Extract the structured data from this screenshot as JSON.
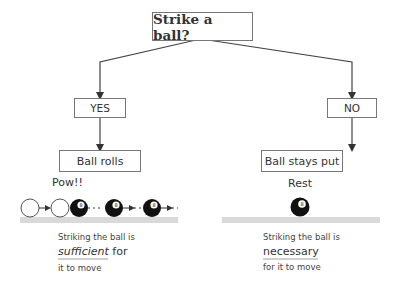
{
  "root": {
    "label": "Strike a ball?"
  },
  "branches": [
    {
      "decision": "YES",
      "outcome": "Ball rolls",
      "scene_label": "Pow!!",
      "caption": {
        "line1": "Striking the ball is",
        "keyword": "sufficient",
        "after_keyword": " for",
        "line3": "it to move"
      }
    },
    {
      "decision": "NO",
      "outcome": "Ball stays put",
      "scene_label": "Rest",
      "caption": {
        "line1": "Striking the ball is",
        "keyword": "necessary",
        "after_keyword": "",
        "line3": "for it to move"
      }
    }
  ],
  "colors": {
    "line": "#444444",
    "box_border": "#777777",
    "floor": "#d9d9d9",
    "ball": "#111111",
    "text": "#333333"
  },
  "icons": {
    "eight_ball": "8"
  }
}
